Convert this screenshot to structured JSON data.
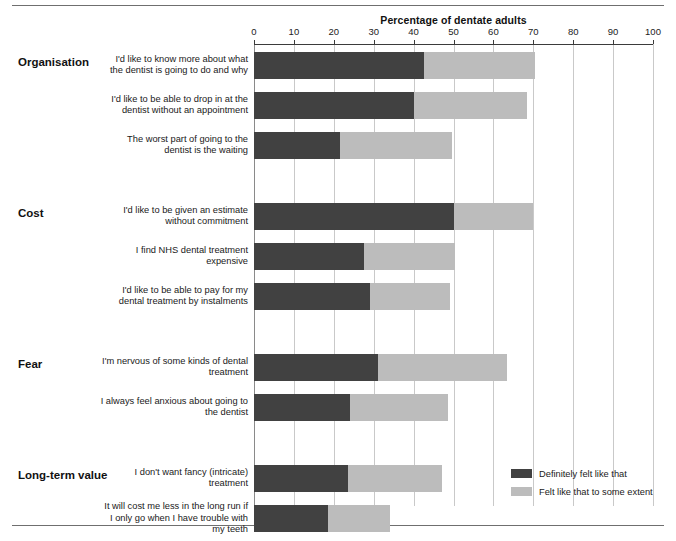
{
  "chart_data": {
    "type": "bar",
    "orientation": "horizontal",
    "stacked": true,
    "title": "",
    "xlabel": "Percentage of dentate adults",
    "ylabel": "",
    "xlim": [
      0,
      100
    ],
    "xticks": [
      0,
      10,
      20,
      30,
      40,
      50,
      60,
      70,
      80,
      90,
      100
    ],
    "grid": true,
    "legend_position": "bottom-right",
    "series": [
      {
        "name": "Definitely felt like that",
        "color": "#414141"
      },
      {
        "name": "Felt like that to some extent",
        "color": "#bcbcbc"
      }
    ],
    "groups": [
      {
        "name": "Organisation",
        "items": [
          {
            "label": "I'd like to know more about what the dentist is going to do and why",
            "definitely": 42.5,
            "some_extent": 28.0,
            "total": 70.5
          },
          {
            "label": "I'd like to be able to drop in at the dentist without an appointment",
            "definitely": 40.0,
            "some_extent": 28.5,
            "total": 68.5
          },
          {
            "label": "The worst part of going to the dentist is the waiting",
            "definitely": 21.5,
            "some_extent": 28.0,
            "total": 49.5
          }
        ]
      },
      {
        "name": "Cost",
        "items": [
          {
            "label": "I'd like to be given an estimate without commitment",
            "definitely": 50.0,
            "some_extent": 20.0,
            "total": 70.0
          },
          {
            "label": "I find NHS dental treatment expensive",
            "definitely": 27.5,
            "some_extent": 23.0,
            "total": 50.5
          },
          {
            "label": "I'd like to be able to pay for my dental treatment by instalments",
            "definitely": 29.0,
            "some_extent": 20.0,
            "total": 49.0
          }
        ]
      },
      {
        "name": "Fear",
        "items": [
          {
            "label": "I'm nervous of some kinds of dental treatment",
            "definitely": 31.0,
            "some_extent": 32.5,
            "total": 63.5
          },
          {
            "label": "I always feel anxious about going to the dentist",
            "definitely": 24.0,
            "some_extent": 24.5,
            "total": 48.5
          }
        ]
      },
      {
        "name": "Long-term value",
        "items": [
          {
            "label": "I don't want fancy (intricate) treatment",
            "definitely": 23.5,
            "some_extent": 23.5,
            "total": 47.0
          },
          {
            "label": "It will cost me less in the long run if I only go when I have trouble with my teeth",
            "definitely": 18.5,
            "some_extent": 15.5,
            "total": 34.0
          },
          {
            "label": "I don't see any point in visiting the dentist unless I need to",
            "definitely": 18.5,
            "some_extent": 17.5,
            "total": 36.0
          }
        ]
      }
    ]
  },
  "axis": {
    "title": "Percentage of dentate adults",
    "tick_labels": [
      "0",
      "10",
      "20",
      "30",
      "40",
      "50",
      "60",
      "70",
      "80",
      "90",
      "100"
    ]
  },
  "groups": [
    {
      "heading": "Organisation"
    },
    {
      "heading": "Cost"
    },
    {
      "heading": "Fear"
    },
    {
      "heading": "Long-term value"
    }
  ],
  "statements": [
    {
      "line1": "I'd like to know more about what",
      "line2": "the dentist is going to do and why",
      "line3": ""
    },
    {
      "line1": "I'd like to be able to drop in at the",
      "line2": "dentist without an appointment",
      "line3": ""
    },
    {
      "line1": "The worst part of going to the",
      "line2": "dentist is the waiting",
      "line3": ""
    },
    {
      "line1": "I'd like to be given an estimate",
      "line2": "without commitment",
      "line3": ""
    },
    {
      "line1": "I find NHS dental treatment",
      "line2": "expensive",
      "line3": ""
    },
    {
      "line1": "I'd like to be able to pay for my",
      "line2": "dental treatment by instalments",
      "line3": ""
    },
    {
      "line1": "I'm nervous of some kinds of dental",
      "line2": "treatment",
      "line3": ""
    },
    {
      "line1": "I always feel anxious about going to",
      "line2": "the dentist",
      "line3": ""
    },
    {
      "line1": "I don't want fancy (intricate)",
      "line2": "treatment",
      "line3": ""
    },
    {
      "line1": "It will cost me less in the long run if",
      "line2": "I only go when I have trouble with",
      "line3": "my teeth"
    },
    {
      "line1": "I don't see any point in visiting the",
      "line2": "dentist unless I need to",
      "line3": ""
    }
  ],
  "legend": {
    "items": [
      {
        "label": "Definitely felt like that",
        "color": "#414141"
      },
      {
        "label": "Felt like that to some extent",
        "color": "#bcbcbc"
      }
    ]
  }
}
